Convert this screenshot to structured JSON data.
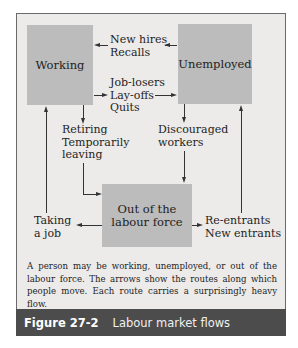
{
  "diagram": {
    "nodes": {
      "working": "Working",
      "unemployed": "Unemployed",
      "out_of_labour_force_line1": "Out of the",
      "out_of_labour_force_line2": "labour force"
    },
    "flows": {
      "unemployed_to_working": [
        "New hires",
        "Recalls"
      ],
      "working_to_unemployed": [
        "Job-losers",
        "Lay-offs",
        "Quits"
      ],
      "working_to_out": [
        "Retiring",
        "Temporarily",
        "leaving"
      ],
      "unemployed_to_out": [
        "Discouraged",
        "workers"
      ],
      "out_to_working": [
        "Taking",
        "a job"
      ],
      "out_to_unemployed": [
        "Re-entrants",
        "New entrants"
      ]
    },
    "colors": {
      "panel_background": "#ecebea",
      "box_fill": "#bcbcbc",
      "caption_bar": "#4c4c4c"
    }
  },
  "description": "A person may be working, unemployed, or out of the labour force. The arrows show the routes along which people move. Each route carries a surprisingly heavy flow.",
  "caption": {
    "number": "Figure 27-2",
    "title": "Labour market flows"
  }
}
